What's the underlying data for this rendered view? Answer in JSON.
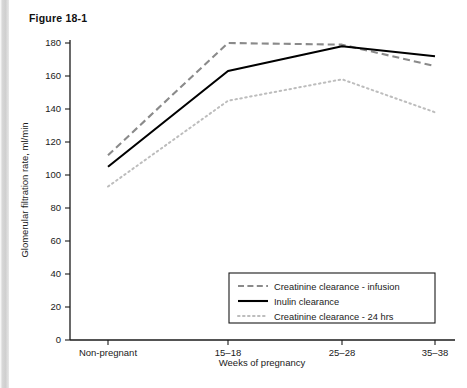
{
  "figure": {
    "label": "Figure 18-1"
  },
  "chart_data": {
    "type": "line",
    "title": "",
    "xlabel": "Weeks of pregnancy",
    "ylabel": "Glomerular filtration rate, ml/min",
    "categories": [
      "Non-pregnant",
      "15–18",
      "25–28",
      "35–38"
    ],
    "ylim": [
      0,
      180
    ],
    "yticks": [
      0,
      20,
      40,
      60,
      80,
      100,
      120,
      140,
      160,
      180
    ],
    "ytick_labels": [
      "0",
      "20",
      "40",
      "60",
      "80",
      "100",
      "120",
      "140",
      "160",
      "180"
    ],
    "grid": false,
    "legend_position": "inside-bottom-right",
    "series": [
      {
        "name": "Creatinine clearance - infusion",
        "style": "dashed",
        "color": "#8a8a8a",
        "values": [
          112,
          180,
          179,
          166
        ]
      },
      {
        "name": "Inulin clearance",
        "style": "solid",
        "color": "#000000",
        "values": [
          105,
          163,
          178,
          172
        ]
      },
      {
        "name": "Creatinine clearance - 24 hrs",
        "style": "dotted",
        "color": "#bdbdbd",
        "values": [
          93,
          145,
          158,
          138
        ]
      }
    ]
  },
  "legend": {
    "items": [
      {
        "label": "Creatinine clearance - infusion"
      },
      {
        "label": "Inulin clearance"
      },
      {
        "label": "Creatinine clearance - 24 hrs"
      }
    ]
  }
}
